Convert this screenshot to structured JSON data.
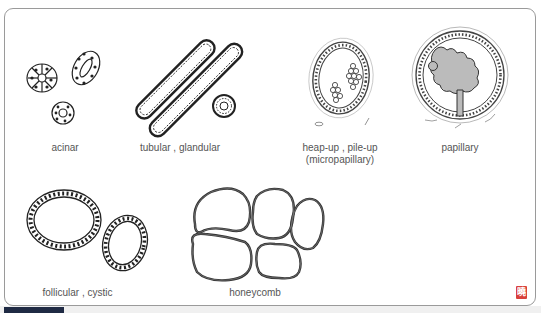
{
  "diagram": {
    "patterns": [
      {
        "id": "acinar",
        "label": "acinar"
      },
      {
        "id": "tubular",
        "label": "tubular ,  glandular"
      },
      {
        "id": "heap-up",
        "label": "heap-up ,  pile-up",
        "sublabel": "(micropapillary)"
      },
      {
        "id": "papillary",
        "label": "papillary"
      },
      {
        "id": "follicular",
        "label": "follicular ,  cystic"
      },
      {
        "id": "honeycomb",
        "label": "honeycomb"
      }
    ],
    "stamp": {
      "glyph": "曉",
      "color": "#d9403a"
    },
    "colors": {
      "frame": "#9a9a9a",
      "tab": "#1f2a44",
      "ink": "#222222",
      "label": "#555555"
    }
  }
}
